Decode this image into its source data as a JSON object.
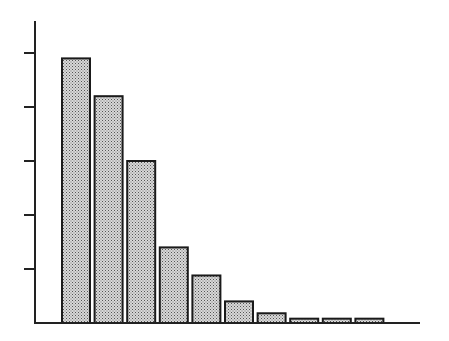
{
  "chart_data": {
    "type": "bar",
    "title": "",
    "xlabel": "",
    "ylabel": "",
    "categories": [
      "1",
      "2",
      "3",
      "4",
      "5",
      "6",
      "7",
      "8",
      "9",
      "10"
    ],
    "values": [
      4.9,
      4.2,
      3.0,
      1.4,
      0.88,
      0.4,
      0.18,
      0.08,
      0.08,
      0.08
    ],
    "ylim": [
      0,
      5.5
    ],
    "yticks": [
      1,
      2,
      3,
      4,
      5
    ],
    "ytick_labels": [],
    "xtick_labels": [],
    "grid": false,
    "legend": null,
    "bar_fill": "#b8b8b8",
    "bar_edge": "#1a1a1a",
    "axis_color": "#222222"
  }
}
